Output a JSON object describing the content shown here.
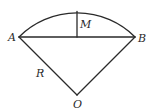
{
  "diagram": {
    "type": "circular-sector-with-segment",
    "labels": {
      "A": "A",
      "B": "B",
      "M": "M",
      "O": "O",
      "R": "R"
    },
    "stroke_color": "#2a2a2a",
    "points": {
      "A": [
        19,
        37
      ],
      "B": [
        135,
        37
      ],
      "O": [
        77,
        95
      ],
      "arc_top": [
        77,
        11
      ],
      "chord_mid": [
        77,
        37
      ]
    },
    "elements": [
      {
        "kind": "arc",
        "from": "A",
        "to": "B",
        "center": "O",
        "description": "arc AB of circle with center O"
      },
      {
        "kind": "segment",
        "from": "A",
        "to": "B",
        "description": "chord AB"
      },
      {
        "kind": "segment",
        "from": "O",
        "to": "A",
        "description": "radius R"
      },
      {
        "kind": "segment",
        "from": "O",
        "to": "B",
        "description": "radius"
      },
      {
        "kind": "segment",
        "from": "arc_top",
        "to": "chord_mid",
        "description": "sagitta labeled M"
      }
    ]
  }
}
